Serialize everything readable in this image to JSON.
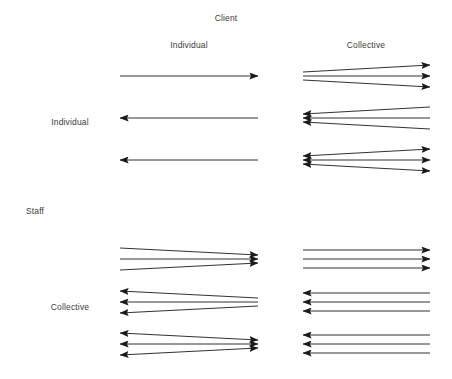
{
  "diagram": {
    "type": "matrix-arrow-diagram",
    "width": 452,
    "height": 379,
    "background_color": "#ffffff",
    "line_color": "#1a1a1a",
    "text_color": "#3a3a3a",
    "axes": {
      "column_axis_title": "Client",
      "row_axis_title": "Staff",
      "column_headers": [
        "Individual",
        "Collective"
      ],
      "row_headers": [
        "Individual",
        "Collective"
      ]
    },
    "labels": {
      "client_title": "Client",
      "staff_title": "Staff",
      "client_individual": "Individual",
      "client_collective": "Collective",
      "staff_individual": "Individual",
      "staff_collective": "Collective"
    },
    "label_positions": {
      "client_title": {
        "x": 226,
        "y": 14
      },
      "client_individual": {
        "x": 189,
        "y": 41
      },
      "client_collective": {
        "x": 366,
        "y": 41
      },
      "staff_title": {
        "x": 26,
        "y": 207
      },
      "staff_individual": {
        "x": 48,
        "y": 118
      },
      "staff_collective": {
        "x": 48,
        "y": 303
      }
    },
    "cells": [
      {
        "id": "individual-individual",
        "staff": "Individual",
        "client": "Individual",
        "pattern": "parallel",
        "groups": [
          {
            "index": 1,
            "direction": "right",
            "count": 1,
            "arrowheads": "end"
          },
          {
            "index": 2,
            "direction": "left",
            "count": 1,
            "arrowheads": "start"
          },
          {
            "index": 3,
            "direction": "left",
            "count": 1,
            "arrowheads": "start"
          }
        ]
      },
      {
        "id": "individual-collective",
        "staff": "Individual",
        "client": "Collective",
        "pattern": "fan-from-left",
        "groups": [
          {
            "index": 1,
            "direction": "right",
            "count": 3,
            "arrowheads": "end"
          },
          {
            "index": 2,
            "direction": "left",
            "count": 3,
            "arrowheads": "start"
          },
          {
            "index": 3,
            "direction": "both",
            "count": 3,
            "arrowheads": "both"
          }
        ]
      },
      {
        "id": "collective-individual",
        "staff": "Collective",
        "client": "Individual",
        "pattern": "fan-to-right",
        "groups": [
          {
            "index": 1,
            "direction": "right",
            "count": 3,
            "arrowheads": "end"
          },
          {
            "index": 2,
            "direction": "left",
            "count": 3,
            "arrowheads": "start"
          },
          {
            "index": 3,
            "direction": "both",
            "count": 3,
            "arrowheads": "both"
          }
        ]
      },
      {
        "id": "collective-collective",
        "staff": "Collective",
        "client": "Collective",
        "pattern": "parallel",
        "groups": [
          {
            "index": 1,
            "direction": "right",
            "count": 3,
            "arrowheads": "end"
          },
          {
            "index": 2,
            "direction": "left",
            "count": 3,
            "arrowheads": "start"
          },
          {
            "index": 3,
            "direction": "left",
            "count": 3,
            "arrowheads": "start"
          }
        ]
      }
    ],
    "geometry": {
      "left_column": {
        "x_start": 120,
        "x_end": 258
      },
      "right_column": {
        "x_start": 303,
        "x_end": 430
      },
      "top_row_groups_y": [
        76,
        118,
        160
      ],
      "bottom_row_groups_y": [
        259,
        302,
        344
      ],
      "fan_spread": 11,
      "group_line_gap": 9
    }
  }
}
